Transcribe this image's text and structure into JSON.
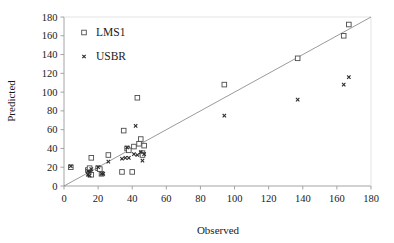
{
  "chart_data": {
    "type": "scatter",
    "title": "",
    "xlabel": "Observed",
    "ylabel": "Predicted",
    "xlim": [
      0,
      180
    ],
    "ylim": [
      0,
      180
    ],
    "xticks": [
      0,
      20,
      40,
      60,
      80,
      100,
      120,
      140,
      160,
      180
    ],
    "yticks": [
      0,
      20,
      40,
      60,
      80,
      100,
      120,
      140,
      160,
      180
    ],
    "grid": false,
    "legend_position": "top-left",
    "reference_line": {
      "type": "identity",
      "from": [
        0,
        0
      ],
      "to": [
        180,
        180
      ],
      "color": "#808080"
    },
    "series": [
      {
        "name": "LMS1",
        "marker": "open-square",
        "color": "#4d4d4d",
        "points": [
          [
            4,
            20
          ],
          [
            14,
            17
          ],
          [
            15,
            19
          ],
          [
            15,
            13
          ],
          [
            16,
            12
          ],
          [
            16,
            30
          ],
          [
            20,
            19
          ],
          [
            21,
            18
          ],
          [
            22,
            13
          ],
          [
            26,
            33
          ],
          [
            34,
            15
          ],
          [
            35,
            59
          ],
          [
            37,
            40
          ],
          [
            38,
            38
          ],
          [
            40,
            15
          ],
          [
            41,
            42
          ],
          [
            43,
            94
          ],
          [
            44,
            45
          ],
          [
            45,
            50
          ],
          [
            46,
            35
          ],
          [
            46,
            33
          ],
          [
            47,
            43
          ],
          [
            94,
            108
          ],
          [
            137,
            136
          ],
          [
            164,
            160
          ],
          [
            167,
            172
          ]
        ]
      },
      {
        "name": "USBR",
        "marker": "cross-x",
        "color": "#2b2b2b",
        "points": [
          [
            4,
            21
          ],
          [
            14,
            16
          ],
          [
            14,
            12
          ],
          [
            15,
            11
          ],
          [
            15,
            15
          ],
          [
            16,
            18
          ],
          [
            20,
            20
          ],
          [
            22,
            13
          ],
          [
            23,
            13
          ],
          [
            26,
            26
          ],
          [
            34,
            29
          ],
          [
            36,
            30
          ],
          [
            37,
            41
          ],
          [
            38,
            30
          ],
          [
            41,
            34
          ],
          [
            42,
            64
          ],
          [
            43,
            33
          ],
          [
            45,
            36
          ],
          [
            46,
            27
          ],
          [
            47,
            34
          ],
          [
            94,
            75
          ],
          [
            137,
            92
          ],
          [
            164,
            108
          ],
          [
            167,
            116
          ]
        ]
      }
    ]
  },
  "axes": {
    "x_title": "Observed",
    "y_title": "Predicted",
    "x_tick_labels": [
      "0",
      "20",
      "40",
      "60",
      "80",
      "100",
      "120",
      "140",
      "160",
      "180"
    ],
    "y_tick_labels": [
      "0",
      "20",
      "40",
      "60",
      "80",
      "100",
      "120",
      "140",
      "160",
      "180"
    ]
  },
  "legend": {
    "entries": [
      {
        "label": "LMS1",
        "marker": "open-square"
      },
      {
        "label": "USBR",
        "marker": "cross-x"
      }
    ]
  }
}
